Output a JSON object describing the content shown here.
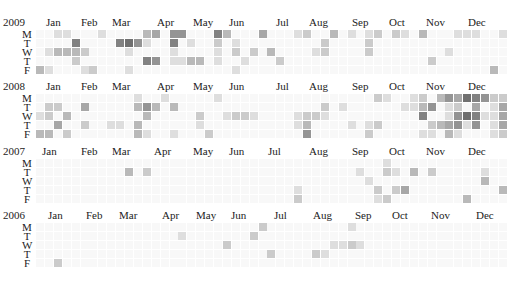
{
  "chart_data": {
    "type": "heatmap",
    "title": "",
    "day_labels": [
      "M",
      "T",
      "W",
      "T",
      "F"
    ],
    "month_labels": [
      "Jan",
      "Feb",
      "Mar",
      "Apr",
      "May",
      "Jun",
      "Jul",
      "Aug",
      "Sep",
      "Oct",
      "Nov",
      "Dec"
    ],
    "scale": {
      "min": 0,
      "max": 9,
      "low_color": "#f7f7f7",
      "high_color": "#555555"
    },
    "years": [
      {
        "year": "2009",
        "top": 16,
        "month_x": [
          46,
          81,
          112,
          157,
          193,
          229,
          276,
          309,
          352,
          389,
          426,
          468
        ],
        "rows": [
          "00110001000034055000630004000120030101202103000111001000000000000000000000",
          "00006000067510060100201000000000200002000000000000000100000000",
          "01333200001000010000102020300001200002000000001000000000000000",
          "00002000000065011330100100020000000000000000200000000000000000",
          "31000120001000000000001000000000000000000000000000030000100000"
        ]
      },
      {
        "year": "2008",
        "top": 80,
        "month_x": [
          46,
          81,
          112,
          157,
          193,
          229,
          276,
          309,
          352,
          389,
          426,
          468
        ],
        "rows": [
          "00000000000100100000100000000000000000210012035476522003060700000",
          "02200400000353030000000000000000201000000113501204014221220000",
          "12030000000030000020012210000122100000000006001576114440310000",
          "00400200110300000010000000000130000101200000234515014440300000",
          "33020000000310010002000000000050000002000001103100012350200000"
        ]
      },
      {
        "year": "2007",
        "top": 145,
        "month_x": [
          42,
          81,
          112,
          154,
          193,
          229,
          268,
          309,
          352,
          389,
          426,
          468
        ],
        "rows": [
          "00000000000000000000000000000000000000010000000000000022000000",
          "00000000003020000000000000000000000010021030200000100300030000",
          "00000000000000000000000000000000000001000000000000300220000000",
          "00000000000000000000000000000100000000202400000000003000000000",
          "00000000000000000000000000000200000000120000000030000000000000"
        ]
      },
      {
        "year": "2006",
        "top": 209,
        "month_x": [
          48,
          86,
          119,
          162,
          196,
          231,
          274,
          313,
          355,
          392,
          431,
          476
        ],
        "rows": [
          "00000000000000000000000002000000000100000000000000000000020000",
          "00000000000000001000000020000000000000000000000000000000000000",
          "00000000000000000000020000000000011210000000000000000000000000",
          "00000000000000000000000000200002100000000000000000000000000000",
          "00200000000000000000000000000000000000000000000000000000000000"
        ]
      }
    ]
  }
}
